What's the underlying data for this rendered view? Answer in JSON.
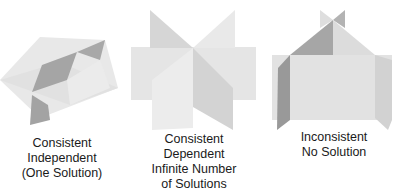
{
  "colors": {
    "light_plane": "#e6e6e6",
    "mid_plane": "#d4d4d4",
    "dark_plane": "#a3a3a3",
    "darker_plane": "#8f8f8f",
    "text": "#1a1a1a"
  },
  "panels": [
    {
      "id": "consistent-independent",
      "lines": [
        "Consistent",
        "Independent",
        "(One Solution)"
      ]
    },
    {
      "id": "consistent-dependent",
      "lines": [
        "Consistent",
        "Dependent",
        "Infinite Number",
        "of Solutions"
      ]
    },
    {
      "id": "inconsistent",
      "lines": [
        "Inconsistent",
        "No Solution"
      ]
    }
  ]
}
